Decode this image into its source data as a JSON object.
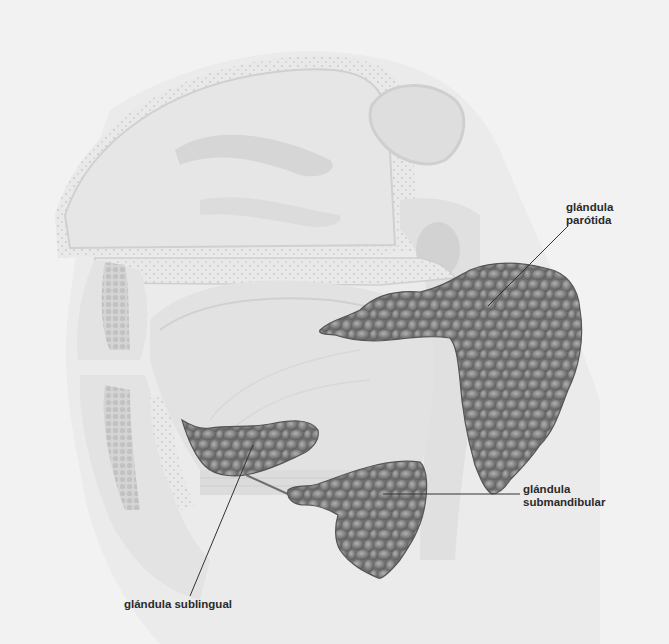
{
  "diagram": {
    "colors": {
      "background": "#f2f2f2",
      "anatomy_light": "#e4e4e4",
      "anatomy_mid": "#cfcfcf",
      "gland_fill": "#7d7d7d",
      "gland_dark": "#5a5a5a",
      "gland_highlight": "#a8a8a8",
      "leader_line": "#333333",
      "label_text": "#2a2a2a"
    },
    "labels": [
      {
        "id": "parotid",
        "line1": "glándula",
        "line2": "parótida"
      },
      {
        "id": "submandibular",
        "line1": "glándula",
        "line2": "submandibular"
      },
      {
        "id": "sublingual",
        "line1": "glándula sublingual",
        "line2": ""
      }
    ]
  }
}
